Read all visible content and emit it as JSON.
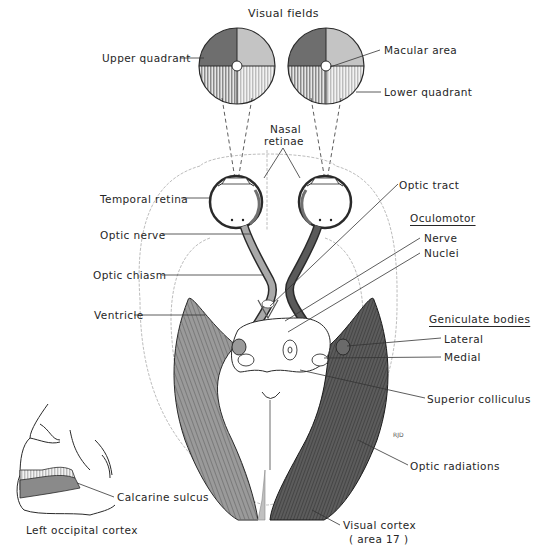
{
  "figure": {
    "title": "Visual fields",
    "colors": {
      "dark_field": "#6e6e6e",
      "light_field": "#c4c4c4",
      "left_pathway": "#a9a9a9",
      "right_pathway": "#5a5a5a",
      "outline": "#2a2a2a",
      "brain_outline": "#b8b8b8"
    },
    "visual_fields": {
      "left_disc": {
        "quadrants": [
          "upper-left dark",
          "upper-right light",
          "lower-left dark striped",
          "lower-right light striped"
        ]
      },
      "right_disc": {
        "quadrants": [
          "upper-left dark",
          "upper-right light",
          "lower-left dark striped",
          "lower-right light striped"
        ]
      }
    },
    "labels": {
      "upper_quadrant": "Upper quadrant",
      "macular_area": "Macular area",
      "lower_quadrant": "Lower quadrant",
      "nasal_retinae_1": "Nasal",
      "nasal_retinae_2": "retinae",
      "temporal_retina": "Temporal retina",
      "optic_nerve": "Optic nerve",
      "optic_chiasm": "Optic chiasm",
      "ventricle": "Ventricle",
      "optic_tract": "Optic tract",
      "oculomotor": "Oculomotor",
      "nerve": "Nerve",
      "nuclei": "Nuclei",
      "geniculate_bodies": "Geniculate bodies",
      "lateral": "Lateral",
      "medial": "Medial",
      "superior_colliculus": "Superior colliculus",
      "optic_radiations": "Optic radiations",
      "visual_cortex_1": "Visual cortex",
      "visual_cortex_2": "( area 17 )",
      "calcarine_sulcus": "Calcarine sulcus",
      "left_occipital_cortex": "Left occipital cortex",
      "artist_initials": "RJD"
    }
  }
}
